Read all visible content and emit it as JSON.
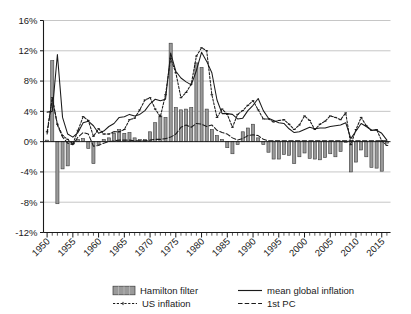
{
  "chart_data": {
    "type": "bar",
    "title": "",
    "xlabel": "",
    "ylabel": "",
    "grid": true,
    "legend_position": "bottom",
    "xlim": [
      1949.3,
      2016.7
    ],
    "ylim": [
      -12,
      16
    ],
    "ytick_labels": [
      "16%",
      "12%",
      "8%",
      "4%",
      "0%",
      "-4%",
      "-8%",
      "-12%"
    ],
    "ytick_values": [
      16,
      12,
      8,
      4,
      0,
      -4,
      -8,
      -12
    ],
    "xtick_labels": [
      "1950",
      "1955",
      "1960",
      "1965",
      "1970",
      "1975",
      "1980",
      "1985",
      "1990",
      "1995",
      "2000",
      "2005",
      "2010",
      "2015"
    ],
    "xtick_values": [
      1950,
      1955,
      1960,
      1965,
      1970,
      1975,
      1980,
      1985,
      1990,
      1995,
      2000,
      2005,
      2010,
      2015
    ],
    "minor_tick_interval": 1,
    "categories": [
      1950,
      1951,
      1952,
      1953,
      1954,
      1955,
      1956,
      1957,
      1958,
      1959,
      1960,
      1961,
      1962,
      1963,
      1964,
      1965,
      1966,
      1967,
      1968,
      1969,
      1970,
      1971,
      1972,
      1973,
      1974,
      1975,
      1976,
      1977,
      1978,
      1979,
      1980,
      1981,
      1982,
      1983,
      1984,
      1985,
      1986,
      1987,
      1988,
      1989,
      1990,
      1991,
      1992,
      1993,
      1994,
      1995,
      1996,
      1997,
      1998,
      1999,
      2000,
      2001,
      2002,
      2003,
      2004,
      2005,
      2006,
      2007,
      2008,
      2009,
      2010,
      2011,
      2012,
      2013,
      2014,
      2015,
      2016
    ],
    "series": [
      {
        "name": "Hamilton filter",
        "type": "bar",
        "color": "#9a9a9a",
        "edge_color": "#3a3a3a",
        "values": [
          0.2,
          10.7,
          -8.2,
          -3.6,
          -3.2,
          -0.3,
          0.3,
          0.4,
          -0.9,
          -2.9,
          -0.4,
          0.3,
          0.5,
          1.1,
          1.6,
          1.1,
          1.2,
          0.5,
          0.3,
          0.3,
          1.3,
          2.5,
          3.4,
          3.2,
          13.0,
          4.5,
          4.2,
          4.3,
          4.5,
          10.4,
          9.8,
          4.3,
          1.6,
          0.8,
          0.3,
          -0.8,
          -1.6,
          -0.4,
          1.3,
          1.8,
          2.3,
          0.5,
          -0.4,
          -1.4,
          -2.3,
          -2.3,
          -1.7,
          -1.8,
          -2.9,
          -2.0,
          -1.5,
          -2.2,
          -2.3,
          -2.4,
          -2.1,
          -1.6,
          -2.0,
          -1.3,
          -0.1,
          -4.0,
          -2.7,
          -1.1,
          -2.0,
          -3.4,
          -3.5,
          -3.9,
          -0.2
        ]
      },
      {
        "name": "mean global inflation",
        "type": "line",
        "style": "solid",
        "color": "#1a1a1a",
        "values": [
          3.9,
          4.0,
          11.5,
          3.2,
          1.0,
          0.6,
          1.2,
          2.5,
          2.7,
          2.1,
          1.1,
          1.4,
          2.0,
          2.4,
          3.2,
          3.3,
          3.6,
          3.4,
          3.6,
          4.1,
          5.0,
          5.6,
          5.4,
          5.6,
          11.7,
          9.3,
          8.4,
          7.9,
          7.5,
          9.4,
          11.8,
          10.6,
          9.1,
          5.5,
          3.7,
          3.7,
          3.6,
          3.0,
          3.1,
          4.1,
          4.8,
          5.7,
          4.1,
          3.1,
          2.8,
          2.5,
          2.4,
          1.7,
          1.2,
          1.3,
          1.6,
          1.9,
          1.7,
          1.8,
          1.8,
          2.0,
          2.1,
          2.2,
          2.5,
          0.4,
          1.4,
          2.4,
          2.0,
          1.5,
          1.5,
          1.1,
          0.2
        ]
      },
      {
        "name": "US inflation",
        "type": "line",
        "style": "dotted-marker",
        "color": "#1a1a1a",
        "values": [
          1.3,
          5.8,
          2.3,
          0.8,
          0.3,
          -0.3,
          1.5,
          3.3,
          2.8,
          0.7,
          1.7,
          1.0,
          1.0,
          1.3,
          1.3,
          1.6,
          2.9,
          3.1,
          4.2,
          5.5,
          5.8,
          4.3,
          3.3,
          6.2,
          11.0,
          9.1,
          5.8,
          6.5,
          7.6,
          11.3,
          12.4,
          12.0,
          6.2,
          3.2,
          4.3,
          3.6,
          1.9,
          3.6,
          4.1,
          4.8,
          5.4,
          4.2,
          3.0,
          3.0,
          2.6,
          2.8,
          2.9,
          2.3,
          1.6,
          2.2,
          3.4,
          2.8,
          1.6,
          2.3,
          2.7,
          3.4,
          3.2,
          2.9,
          3.8,
          -0.4,
          1.6,
          3.2,
          2.1,
          1.5,
          1.6,
          0.1,
          -0.5
        ]
      },
      {
        "name": "1st PC",
        "type": "line",
        "style": "dashed",
        "color": "#1a1a1a",
        "values": [
          1.0,
          5.7,
          2.2,
          0.6,
          -0.2,
          -0.4,
          0.6,
          1.2,
          1.0,
          -0.6,
          -0.5,
          -0.2,
          0.0,
          0.1,
          0.2,
          0.2,
          0.2,
          0.1,
          0.1,
          0.1,
          0.2,
          0.3,
          0.3,
          0.4,
          0.6,
          1.0,
          1.9,
          2.2,
          1.9,
          2.4,
          2.3,
          2.0,
          2.2,
          1.5,
          1.2,
          1.0,
          0.5,
          0.2,
          0.4,
          0.8,
          0.9,
          0.8,
          0.3,
          0.1,
          0.1,
          0.1,
          0.1,
          0.1,
          0.1,
          0.1,
          0.1,
          0.1,
          0.1,
          0.1,
          0.1,
          0.1,
          0.1,
          0.1,
          0.1,
          0.1,
          0.1,
          0.1,
          0.1,
          0.1,
          0.1,
          0.1,
          0.1
        ]
      }
    ]
  },
  "legend": {
    "items": [
      {
        "label": "Hamilton filter",
        "marker": "bar-swatch"
      },
      {
        "label": "mean global inflation",
        "marker": "solid-line"
      },
      {
        "label": "US inflation",
        "marker": "dotted-marker-line"
      },
      {
        "label": "1st PC",
        "marker": "dashed-line"
      }
    ]
  },
  "colors": {
    "bar_fill": "#9a9a9a",
    "bar_edge": "#3a3a3a",
    "line": "#1a1a1a",
    "grid": "#b8b8b8",
    "axis": "#1a1a1a",
    "background": "#ffffff"
  }
}
